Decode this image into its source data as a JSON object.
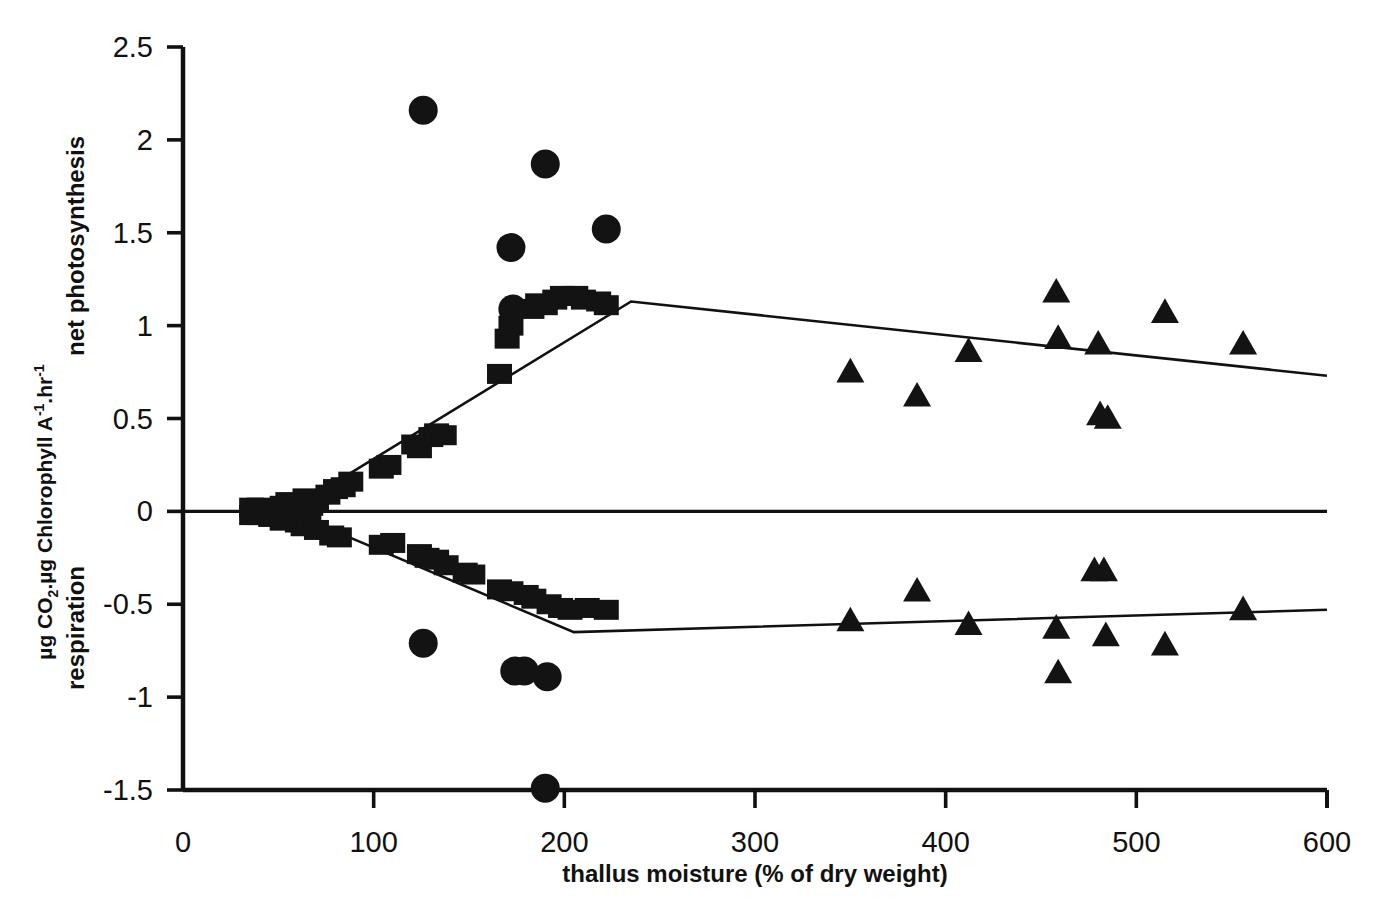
{
  "chart_data": {
    "type": "scatter",
    "title": "",
    "xlabel": "thallus moisture (% of dry weight)",
    "ylabel_line1": "µg CO2.µg Chlorophyll A-1.hr-1",
    "ylabel_line2": "net photosynthesis",
    "ylabel_lower": "respiration",
    "xlim": [
      0,
      600
    ],
    "ylim": [
      -1.5,
      2.5
    ],
    "xticks": [
      0,
      100,
      200,
      300,
      400,
      500,
      600
    ],
    "xtick_labels": [
      "0",
      "100",
      "200",
      "300",
      "400",
      "500",
      "600"
    ],
    "yticks": [
      2.5,
      2,
      1.5,
      1,
      0.5,
      0,
      -0.5,
      -1,
      -1.5
    ],
    "ytick_labels": [
      "2.5",
      "2",
      "1.5",
      "1",
      "0.5",
      "0",
      "-0.5",
      "-1",
      "-1.5"
    ],
    "grid": false,
    "legend": "none",
    "zero_line": 0,
    "marker_color": "#131313",
    "line_color": "#111111",
    "series": [
      {
        "name": "net photosynthesis - squares",
        "marker": "square",
        "points": [
          [
            36,
            0.02
          ],
          [
            40,
            0.02
          ],
          [
            44,
            0.01
          ],
          [
            52,
            0.03
          ],
          [
            55,
            0.05
          ],
          [
            58,
            0.02
          ],
          [
            61,
            0.04
          ],
          [
            64,
            0.07
          ],
          [
            67,
            0.03
          ],
          [
            70,
            0.06
          ],
          [
            76,
            0.09
          ],
          [
            80,
            0.12
          ],
          [
            84,
            0.13
          ],
          [
            88,
            0.16
          ],
          [
            104,
            0.23
          ],
          [
            108,
            0.25
          ],
          [
            121,
            0.36
          ],
          [
            124,
            0.34
          ],
          [
            130,
            0.4
          ],
          [
            133,
            0.42
          ],
          [
            137,
            0.41
          ],
          [
            166,
            0.74
          ],
          [
            170,
            0.93
          ],
          [
            172,
            1.0
          ],
          [
            183,
            1.09
          ],
          [
            186,
            1.12
          ],
          [
            190,
            1.11
          ],
          [
            195,
            1.14
          ],
          [
            199,
            1.16
          ],
          [
            206,
            1.16
          ],
          [
            210,
            1.14
          ],
          [
            218,
            1.13
          ],
          [
            222,
            1.11
          ]
        ]
      },
      {
        "name": "net photosynthesis - circles",
        "marker": "circle",
        "points": [
          [
            126,
            2.16
          ],
          [
            172,
            1.42
          ],
          [
            173,
            1.09
          ],
          [
            190,
            1.87
          ],
          [
            222,
            1.52
          ]
        ]
      },
      {
        "name": "net photosynthesis - triangles",
        "marker": "triangle",
        "points": [
          [
            350,
            0.75
          ],
          [
            385,
            0.62
          ],
          [
            412,
            0.86
          ],
          [
            458,
            1.18
          ],
          [
            459,
            0.93
          ],
          [
            480,
            0.9
          ],
          [
            481,
            0.52
          ],
          [
            485,
            0.5
          ],
          [
            515,
            1.07
          ],
          [
            556,
            0.9
          ]
        ]
      },
      {
        "name": "respiration - squares",
        "marker": "square",
        "points": [
          [
            36,
            -0.02
          ],
          [
            40,
            -0.02
          ],
          [
            46,
            -0.03
          ],
          [
            52,
            -0.05
          ],
          [
            56,
            -0.04
          ],
          [
            60,
            -0.06
          ],
          [
            63,
            -0.08
          ],
          [
            66,
            -0.07
          ],
          [
            70,
            -0.1
          ],
          [
            78,
            -0.13
          ],
          [
            82,
            -0.14
          ],
          [
            104,
            -0.18
          ],
          [
            110,
            -0.17
          ],
          [
            124,
            -0.23
          ],
          [
            128,
            -0.25
          ],
          [
            133,
            -0.26
          ],
          [
            138,
            -0.29
          ],
          [
            148,
            -0.33
          ],
          [
            152,
            -0.34
          ],
          [
            166,
            -0.42
          ],
          [
            172,
            -0.43
          ],
          [
            180,
            -0.45
          ],
          [
            184,
            -0.47
          ],
          [
            192,
            -0.5
          ],
          [
            198,
            -0.52
          ],
          [
            203,
            -0.53
          ],
          [
            212,
            -0.52
          ],
          [
            222,
            -0.53
          ]
        ]
      },
      {
        "name": "respiration - circles",
        "marker": "circle",
        "points": [
          [
            126,
            -0.71
          ],
          [
            174,
            -0.86
          ],
          [
            179,
            -0.86
          ],
          [
            191,
            -0.89
          ],
          [
            190,
            -1.49
          ]
        ]
      },
      {
        "name": "respiration - triangles",
        "marker": "triangle",
        "points": [
          [
            350,
            -0.59
          ],
          [
            385,
            -0.43
          ],
          [
            412,
            -0.61
          ],
          [
            458,
            -0.63
          ],
          [
            459,
            -0.87
          ],
          [
            478,
            -0.32
          ],
          [
            483,
            -0.32
          ],
          [
            484,
            -0.67
          ],
          [
            515,
            -0.72
          ],
          [
            556,
            -0.53
          ]
        ]
      }
    ],
    "fit_lines": [
      {
        "name": "net photosynthesis fit",
        "vertices": [
          [
            55,
            0.0
          ],
          [
            235,
            1.13
          ],
          [
            600,
            0.73
          ]
        ]
      },
      {
        "name": "respiration fit",
        "vertices": [
          [
            55,
            0.0
          ],
          [
            205,
            -0.65
          ],
          [
            600,
            -0.53
          ]
        ]
      }
    ]
  }
}
